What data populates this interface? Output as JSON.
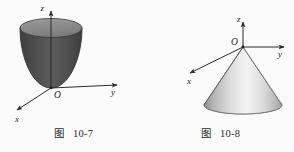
{
  "page": {
    "background_color": "#fbfbfb",
    "width": 294,
    "height": 152
  },
  "figures": [
    {
      "id": "figure-10-7",
      "caption_word": "图",
      "caption_number": "10-7",
      "shape": "paraboloid",
      "shape_description": "upward-opening elliptic paraboloid with vertex at origin",
      "axes": {
        "z_label": "z",
        "y_label": "y",
        "x_label": "x",
        "origin_label": "O"
      },
      "colors": {
        "body_dark": "#4a4a4a",
        "body_mid": "#565656",
        "top_ellipse": "#8a8a8a",
        "outline": "#3a3a3a",
        "axis": "#2b2b2b"
      }
    },
    {
      "id": "figure-10-8",
      "caption_word": "图",
      "caption_number": "10-8",
      "shape": "cone",
      "shape_description": "downward-opening circular cone with apex at origin",
      "axes": {
        "z_label": "z",
        "y_label": "y",
        "x_label": "x",
        "origin_label": "O"
      },
      "colors": {
        "body_light": "#f2f2f2",
        "body_mid": "#c9c9c9",
        "body_dark": "#9a9a9a",
        "outline": "#5a5a5a",
        "axis": "#2b2b2b"
      }
    }
  ]
}
